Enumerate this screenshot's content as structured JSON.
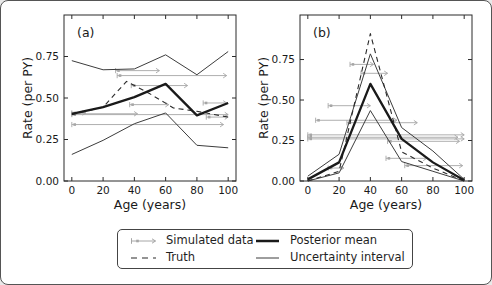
{
  "figure": {
    "colors": {
      "posterior_mean": "#1a1a1a",
      "truth": "#2b2b2b",
      "uncertainty": "#3c3c3c",
      "simulated": "#a6a6a6",
      "frame": "#2b2b2b",
      "text": "#1a1a1a",
      "background": "#ffffff"
    },
    "legend": {
      "items": [
        {
          "key": "simulated-data",
          "label": "Simulated data"
        },
        {
          "key": "truth",
          "label": "Truth"
        },
        {
          "key": "posterior-mean",
          "label": "Posterior mean"
        },
        {
          "key": "uncertainty-interval",
          "label": "Uncertainty interval"
        }
      ]
    },
    "panels": [
      {
        "panel_letter": "(a)",
        "xlabel": "Age (years)",
        "ylabel": "Rate (per PY)",
        "xlim": [
          -5,
          105
        ],
        "ylim": [
          0,
          1.0
        ],
        "xtick_values": [
          0,
          20,
          40,
          60,
          80,
          100
        ],
        "xtick_labels": [
          "0",
          "20",
          "40",
          "60",
          "80",
          "100"
        ],
        "ytick_values": [
          0.0,
          0.25,
          0.5,
          0.75
        ],
        "ytick_labels": [
          "0.00",
          "0.25",
          "0.50",
          "0.75"
        ],
        "chart_data": {
          "type": "line",
          "title": "",
          "series": [
            {
              "name": "Uncertainty interval (upper)",
              "role": "unc",
              "x": [
                0,
                20,
                40,
                60,
                80,
                100
              ],
              "y": [
                0.725,
                0.67,
                0.675,
                0.76,
                0.64,
                0.78
              ]
            },
            {
              "name": "Uncertainty interval (lower)",
              "role": "unc",
              "x": [
                0,
                20,
                40,
                60,
                80,
                100
              ],
              "y": [
                0.16,
                0.245,
                0.345,
                0.41,
                0.215,
                0.2
              ]
            },
            {
              "name": "Truth",
              "role": "truth",
              "x": [
                0,
                20,
                35,
                50,
                65,
                80,
                100
              ],
              "y": [
                0.4,
                0.445,
                0.6,
                0.525,
                0.44,
                0.42,
                0.385
              ]
            },
            {
              "name": "Posterior mean",
              "role": "mean",
              "x": [
                0,
                20,
                40,
                60,
                80,
                100
              ],
              "y": [
                0.405,
                0.445,
                0.505,
                0.585,
                0.395,
                0.47
              ]
            }
          ],
          "simulated_data_intervals": [
            {
              "age_start": 28,
              "age_end": 56,
              "rate": 0.665
            },
            {
              "age_start": 29,
              "age_end": 99,
              "rate": 0.635
            },
            {
              "age_start": 38,
              "age_end": 74,
              "rate": 0.575
            },
            {
              "age_start": 84,
              "age_end": 99,
              "rate": 0.47
            },
            {
              "age_start": 37,
              "age_end": 62,
              "rate": 0.46
            },
            {
              "age_start": 0,
              "age_end": 9,
              "rate": 0.41
            },
            {
              "age_start": 0,
              "age_end": 42,
              "rate": 0.405
            },
            {
              "age_start": 0,
              "age_end": 100,
              "rate": 0.4
            },
            {
              "age_start": 86,
              "age_end": 100,
              "rate": 0.385
            },
            {
              "age_start": 0,
              "age_end": 97,
              "rate": 0.34
            }
          ]
        }
      },
      {
        "panel_letter": "(b)",
        "xlabel": "Age (years)",
        "ylabel": "Rate (per PY)",
        "xlim": [
          -5,
          105
        ],
        "ylim": [
          0,
          1.025
        ],
        "xtick_values": [
          0,
          20,
          40,
          60,
          80,
          100
        ],
        "xtick_labels": [
          "0",
          "20",
          "40",
          "60",
          "80",
          "100"
        ],
        "ytick_values": [
          0.0,
          0.25,
          0.5,
          0.75
        ],
        "ytick_labels": [
          "0.00",
          "0.25",
          "0.50",
          "0.75"
        ],
        "chart_data": {
          "type": "line",
          "title": "",
          "series": [
            {
              "name": "Uncertainty interval (upper)",
              "role": "unc",
              "x": [
                0,
                20,
                40,
                60,
                80,
                100
              ],
              "y": [
                0.03,
                0.165,
                0.785,
                0.33,
                0.185,
                0.01
              ]
            },
            {
              "name": "Uncertainty interval (lower)",
              "role": "unc",
              "x": [
                0,
                20,
                40,
                60,
                80,
                100
              ],
              "y": [
                0.0,
                0.05,
                0.435,
                0.12,
                0.06,
                0.0
              ]
            },
            {
              "name": "Truth",
              "role": "truth",
              "x": [
                0,
                20,
                40,
                60,
                80,
                100
              ],
              "y": [
                0.0,
                0.06,
                0.91,
                0.18,
                0.08,
                0.0
              ]
            },
            {
              "name": "Posterior mean",
              "role": "mean",
              "x": [
                0,
                20,
                40,
                60,
                80,
                100
              ],
              "y": [
                0.01,
                0.115,
                0.6,
                0.26,
                0.115,
                0.005
              ]
            }
          ],
          "simulated_data_intervals": [
            {
              "age_start": 27,
              "age_end": 42,
              "rate": 0.72
            },
            {
              "age_start": 34,
              "age_end": 51,
              "rate": 0.665
            },
            {
              "age_start": 13,
              "age_end": 40,
              "rate": 0.465
            },
            {
              "age_start": 5,
              "age_end": 57,
              "rate": 0.375
            },
            {
              "age_start": 25,
              "age_end": 70,
              "rate": 0.36
            },
            {
              "age_start": 0,
              "age_end": 100,
              "rate": 0.285
            },
            {
              "age_start": 0,
              "age_end": 96,
              "rate": 0.27
            },
            {
              "age_start": 0,
              "age_end": 100,
              "rate": 0.26
            },
            {
              "age_start": 51,
              "age_end": 97,
              "rate": 0.245
            },
            {
              "age_start": 50,
              "age_end": 76,
              "rate": 0.14
            },
            {
              "age_start": 62,
              "age_end": 99,
              "rate": 0.095
            },
            {
              "age_start": 13,
              "age_end": 23,
              "rate": 0.08
            }
          ]
        }
      }
    ]
  }
}
